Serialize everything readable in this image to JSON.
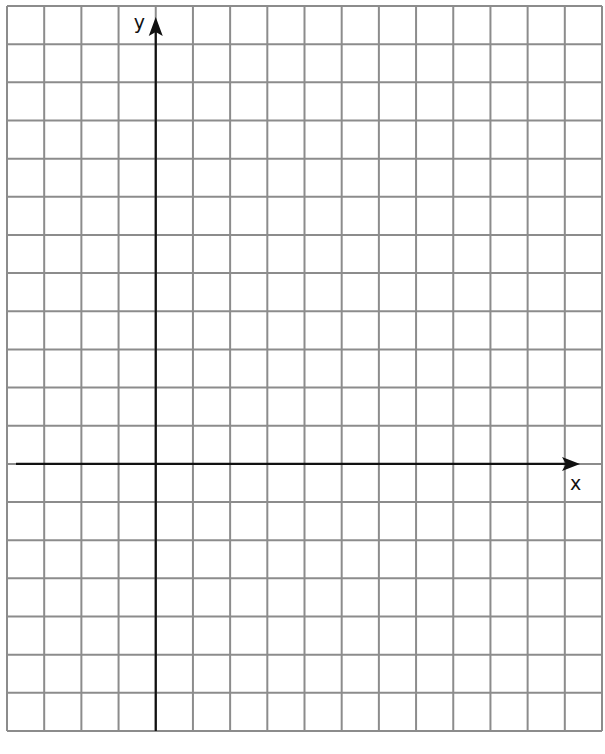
{
  "grid": {
    "columns": 16,
    "rows": 19,
    "left": 7,
    "top": 6,
    "right": 602,
    "bottom": 731,
    "line_color": "#8c8c8c",
    "line_width": 2
  },
  "axes": {
    "y_axis_column": 4,
    "x_axis_row": 12,
    "color": "#111111",
    "x_label": "x",
    "y_label": "y"
  },
  "chart_data": {
    "type": "scatter",
    "title": "",
    "xlabel": "x",
    "ylabel": "y",
    "grid": true,
    "x_range": [
      -4,
      12
    ],
    "y_range": [
      -7,
      12
    ],
    "series": []
  }
}
